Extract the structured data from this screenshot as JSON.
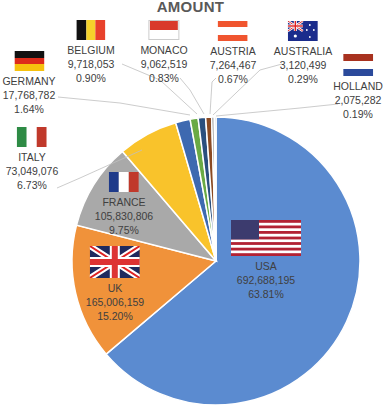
{
  "title": "AMOUNT",
  "chart_data": {
    "type": "pie",
    "title": "AMOUNT",
    "categories": [
      "USA",
      "UK",
      "FRANCE",
      "ITALY",
      "GERMANY",
      "BELGIUM",
      "MONACO",
      "AUSTRIA",
      "AUSTRALIA",
      "HOLLAND"
    ],
    "values": [
      692688195,
      165006159,
      105830806,
      73049076,
      17768782,
      9718053,
      9062519,
      7264467,
      3120499,
      2075282
    ],
    "value_labels": [
      "692,688,195",
      "165,006,159",
      "105,830,806",
      "73,049,076",
      "17,768,782",
      "9,718,053",
      "9,062,519",
      "7,264,467",
      "3,120,499",
      "2,075,282"
    ],
    "percentages": [
      "63.81%",
      "15.20%",
      "9.75%",
      "6.73%",
      "1.64%",
      "0.90%",
      "0.83%",
      "0.67%",
      "0.29%",
      "0.19%"
    ],
    "colors": [
      "#5B8BD0",
      "#F0923A",
      "#A9A9A9",
      "#F9C32B",
      "#3E69B0",
      "#6AAA45",
      "#2A4F7E",
      "#8B4A22",
      "#7F7F7F",
      "#98A8C0"
    ],
    "start_angle_deg": 0,
    "direction": "clockwise",
    "legend": "none (data labels with flags)"
  },
  "labels": [
    {
      "name": "USA",
      "value": "692,688,195",
      "pct": "63.81%",
      "flag": "usa-flag"
    },
    {
      "name": "UK",
      "value": "165,006,159",
      "pct": "15.20%",
      "flag": "uk-flag"
    },
    {
      "name": "FRANCE",
      "value": "105,830,806",
      "pct": "9.75%",
      "flag": "france-flag"
    },
    {
      "name": "ITALY",
      "value": "73,049,076",
      "pct": "6.73%",
      "flag": "italy-flag"
    },
    {
      "name": "GERMANY",
      "value": "17,768,782",
      "pct": "1.64%",
      "flag": "germany-flag"
    },
    {
      "name": "BELGIUM",
      "value": "9,718,053",
      "pct": "0.90%",
      "flag": "belgium-flag"
    },
    {
      "name": "MONACO",
      "value": "9,062,519",
      "pct": "0.83%",
      "flag": "monaco-flag"
    },
    {
      "name": "AUSTRIA",
      "value": "7,264,467",
      "pct": "0.67%",
      "flag": "austria-flag"
    },
    {
      "name": "AUSTRALIA",
      "value": "3,120,499",
      "pct": "0.29%",
      "flag": "australia-flag"
    },
    {
      "name": "HOLLAND",
      "value": "2,075,282",
      "pct": "0.19%",
      "flag": "holland-flag"
    }
  ]
}
